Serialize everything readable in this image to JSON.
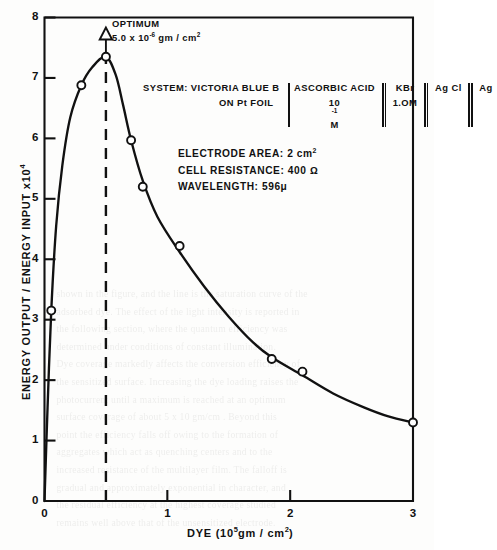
{
  "figure": {
    "optimum": {
      "label": "OPTIMUM",
      "value_prefix": "5.0 x 10",
      "value_exponent": "-6",
      "value_units": " gm / cm",
      "value_units_exponent": "2",
      "marker_x": 0.5
    },
    "system": {
      "line1": "SYSTEM: VICTORIA BLUE B",
      "line2": "ON  Pt FOIL",
      "cell": [
        {
          "name": "ASCORBIC ACID",
          "sub_prefix": "10",
          "sub_exponent": "-1",
          "sub_suffix": " M"
        },
        {
          "name": "KBr",
          "sub_prefix": "1.OM",
          "sub_exponent": "",
          "sub_suffix": ""
        },
        {
          "name": "Ag Cl",
          "sub_prefix": "",
          "sub_exponent": "",
          "sub_suffix": ""
        },
        {
          "name": "Ag",
          "sub_prefix": "",
          "sub_exponent": "",
          "sub_suffix": ""
        }
      ]
    },
    "params": [
      {
        "label": "ELECTRODE AREA: 2 cm",
        "exponent": "2"
      },
      {
        "label": "CELL  RESISTANCE: 400 Ω",
        "exponent": ""
      },
      {
        "label": "WAVELENGTH: 596μ",
        "exponent": ""
      }
    ],
    "bleed_text": [
      "shown in the figure, and the line is the saturation curve of the",
      "adsorbed dye. The effect of the light intensity is reported in",
      "the following section, where the quantum efficiency was",
      "determined under conditions of constant illumination.",
      "",
      "Dye coverage markedly affects the conversion efficiency of",
      "the sensitized surface. Increasing the dye loading raises the",
      "photocurrent until a maximum is reached at an optimum",
      "surface coverage of about 5 x 10 gm/cm . Beyond this",
      "point the efficiency falls off owing to the formation of",
      "aggregates which act as quenching centers and to the",
      "increased resistance of the multilayer film. The falloff is",
      "gradual and approximately exponential in character, and",
      "the residual efficiency at the highest coverage studied",
      "remains well above that of the unsensitized electrode."
    ]
  },
  "chart_data": {
    "type": "line",
    "title": "",
    "xlabel_prefix": "DYE  (10",
    "xlabel_exponent": "5",
    "xlabel_suffix": "gm / cm",
    "xlabel_suffix_exponent": "2",
    "xlabel_close": ")",
    "ylabel_prefix": "ENERGY  OUTPUT / ENERGY  INPUT  x10",
    "ylabel_exponent": "4",
    "xlim": [
      0,
      3
    ],
    "ylim": [
      0,
      8
    ],
    "xticks": [
      0,
      1,
      2,
      3
    ],
    "xtick_labels": [
      "0",
      "1",
      "2",
      "3"
    ],
    "yticks": [
      0,
      1,
      2,
      3,
      4,
      5,
      6,
      7,
      8
    ],
    "ytick_labels": [
      "0",
      "1",
      "2",
      "3",
      "4",
      "5",
      "6",
      "7",
      "8"
    ],
    "grid": false,
    "legend": "none",
    "series": [
      {
        "name": "Energy output / energy input",
        "marker": "open-circle",
        "points": [
          {
            "x": 0.055,
            "y": 3.15
          },
          {
            "x": 0.3,
            "y": 6.88
          },
          {
            "x": 0.5,
            "y": 7.35
          },
          {
            "x": 0.705,
            "y": 5.97
          },
          {
            "x": 0.8,
            "y": 5.2
          },
          {
            "x": 1.1,
            "y": 4.22
          },
          {
            "x": 1.85,
            "y": 2.35
          },
          {
            "x": 2.1,
            "y": 2.14
          },
          {
            "x": 3.0,
            "y": 1.3
          }
        ],
        "curve": [
          {
            "x": 0.0,
            "y": 0.0
          },
          {
            "x": 0.025,
            "y": 1.55
          },
          {
            "x": 0.055,
            "y": 3.15
          },
          {
            "x": 0.095,
            "y": 4.55
          },
          {
            "x": 0.145,
            "y": 5.55
          },
          {
            "x": 0.21,
            "y": 6.35
          },
          {
            "x": 0.3,
            "y": 6.88
          },
          {
            "x": 0.39,
            "y": 7.18
          },
          {
            "x": 0.5,
            "y": 7.35
          },
          {
            "x": 0.58,
            "y": 7.05
          },
          {
            "x": 0.64,
            "y": 6.55
          },
          {
            "x": 0.705,
            "y": 5.97
          },
          {
            "x": 0.8,
            "y": 5.3
          },
          {
            "x": 0.92,
            "y": 4.7
          },
          {
            "x": 1.1,
            "y": 4.12
          },
          {
            "x": 1.3,
            "y": 3.55
          },
          {
            "x": 1.5,
            "y": 3.05
          },
          {
            "x": 1.7,
            "y": 2.62
          },
          {
            "x": 1.85,
            "y": 2.38
          },
          {
            "x": 2.1,
            "y": 2.08
          },
          {
            "x": 2.35,
            "y": 1.78
          },
          {
            "x": 2.6,
            "y": 1.55
          },
          {
            "x": 2.8,
            "y": 1.4
          },
          {
            "x": 3.0,
            "y": 1.3
          }
        ]
      }
    ]
  }
}
